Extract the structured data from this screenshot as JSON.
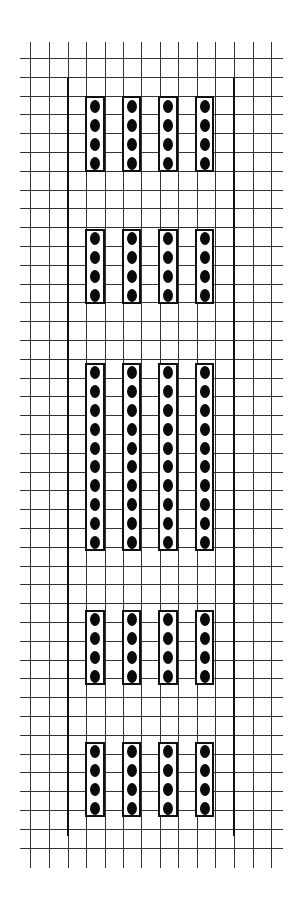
{
  "diagram": {
    "type": "grid-dot-arrangement",
    "grid": {
      "columns_x": [
        30,
        49,
        68,
        86,
        105,
        123,
        141,
        160,
        178,
        197,
        215,
        234,
        253,
        271
      ],
      "row_start_y": 58,
      "row_step": 18.8,
      "row_count": 43,
      "line_color": "#333333",
      "vertical_top": 42,
      "vertical_bottom": 868,
      "horizontal_left": 20,
      "horizontal_right": 283
    },
    "borders": {
      "left_x": 67,
      "right_x": 233,
      "top_y": 78,
      "bottom_y": 836,
      "color": "#111111"
    },
    "groups": [
      {
        "name": "group-1",
        "top": 96,
        "bottom": 172,
        "dots_per_column": 4
      },
      {
        "name": "group-2",
        "top": 229,
        "bottom": 304,
        "dots_per_column": 4
      },
      {
        "name": "group-3",
        "top": 363,
        "bottom": 551,
        "dots_per_column": 10
      },
      {
        "name": "group-4",
        "top": 610,
        "bottom": 685,
        "dots_per_column": 4
      },
      {
        "name": "group-5",
        "top": 742,
        "bottom": 817,
        "dots_per_column": 4
      }
    ],
    "box_columns": [
      {
        "left": 85,
        "width": 20
      },
      {
        "left": 122,
        "width": 19
      },
      {
        "left": 158,
        "width": 20
      },
      {
        "left": 195,
        "width": 19
      }
    ],
    "dot_color": "#0a0a0a",
    "total_dots": 104
  }
}
